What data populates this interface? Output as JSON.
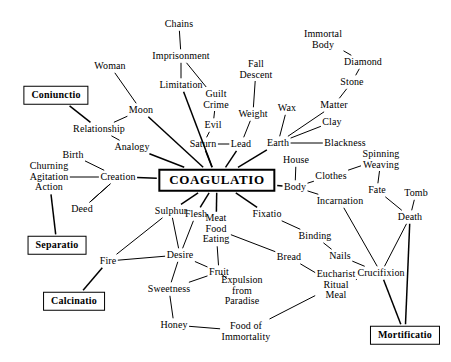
{
  "diagram": {
    "center": {
      "id": "coagulatio",
      "label": "COAGULATIO",
      "x": 217,
      "y": 180,
      "type": "center"
    },
    "operations": [
      {
        "id": "coniunctio",
        "label": "Coniunctio",
        "x": 56,
        "y": 95,
        "type": "op"
      },
      {
        "id": "separatio",
        "label": "Separatio",
        "x": 57,
        "y": 245,
        "type": "op"
      },
      {
        "id": "calcinatio",
        "label": "Calcinatio",
        "x": 74,
        "y": 301,
        "type": "op"
      },
      {
        "id": "mortificatio",
        "label": "Mortificatio",
        "x": 405,
        "y": 335,
        "type": "op"
      }
    ],
    "nodes": [
      {
        "id": "chains",
        "label": "Chains",
        "x": 179,
        "y": 24
      },
      {
        "id": "imprisonment",
        "label": "Imprisonment",
        "x": 181,
        "y": 56
      },
      {
        "id": "limitation",
        "label": "Limitation",
        "x": 181,
        "y": 85
      },
      {
        "id": "woman",
        "label": "Woman",
        "x": 110,
        "y": 66
      },
      {
        "id": "moon",
        "label": "Moon",
        "x": 141,
        "y": 110
      },
      {
        "id": "relationship",
        "label": "Relationship",
        "x": 99,
        "y": 129
      },
      {
        "id": "analogy",
        "label": "Analogy",
        "x": 132,
        "y": 147
      },
      {
        "id": "birth",
        "label": "Birth",
        "x": 73,
        "y": 155
      },
      {
        "id": "churning",
        "label": "Churning\nAgitation\nAction",
        "x": 49,
        "y": 177
      },
      {
        "id": "creation",
        "label": "Creation",
        "x": 118,
        "y": 177
      },
      {
        "id": "deed",
        "label": "Deed",
        "x": 82,
        "y": 209
      },
      {
        "id": "guiltcrime",
        "label": "Guilt\nCrime",
        "x": 216,
        "y": 99
      },
      {
        "id": "evil",
        "label": "Evil",
        "x": 213,
        "y": 125
      },
      {
        "id": "saturn",
        "label": "Saturn",
        "x": 203,
        "y": 144
      },
      {
        "id": "lead",
        "label": "Lead",
        "x": 241,
        "y": 144
      },
      {
        "id": "falldescent",
        "label": "Fall\nDescent",
        "x": 256,
        "y": 69
      },
      {
        "id": "weight",
        "label": "Weight",
        "x": 253,
        "y": 114
      },
      {
        "id": "wax",
        "label": "Wax",
        "x": 287,
        "y": 108
      },
      {
        "id": "immortalbody",
        "label": "Immortal\nBody",
        "x": 323,
        "y": 39
      },
      {
        "id": "diamond",
        "label": "Diamond",
        "x": 363,
        "y": 62
      },
      {
        "id": "stone",
        "label": "Stone",
        "x": 352,
        "y": 82
      },
      {
        "id": "matter",
        "label": "Matter",
        "x": 334,
        "y": 105
      },
      {
        "id": "clay",
        "label": "Clay",
        "x": 332,
        "y": 122
      },
      {
        "id": "earth",
        "label": "Earth",
        "x": 278,
        "y": 143
      },
      {
        "id": "blackness",
        "label": "Blackness",
        "x": 345,
        "y": 143
      },
      {
        "id": "house",
        "label": "House",
        "x": 296,
        "y": 160
      },
      {
        "id": "body",
        "label": "Body",
        "x": 295,
        "y": 187
      },
      {
        "id": "clothes",
        "label": "Clothes",
        "x": 331,
        "y": 176
      },
      {
        "id": "spinning",
        "label": "Spinning\nWeaving",
        "x": 381,
        "y": 159
      },
      {
        "id": "fate",
        "label": "Fate",
        "x": 377,
        "y": 190
      },
      {
        "id": "incarnation",
        "label": "Incarnation",
        "x": 340,
        "y": 201
      },
      {
        "id": "tomb",
        "label": "Tomb",
        "x": 416,
        "y": 193
      },
      {
        "id": "death",
        "label": "Death",
        "x": 410,
        "y": 217
      },
      {
        "id": "fixatio",
        "label": "Fixatio",
        "x": 267,
        "y": 214
      },
      {
        "id": "binding",
        "label": "Binding",
        "x": 315,
        "y": 236
      },
      {
        "id": "nails",
        "label": "Nails",
        "x": 340,
        "y": 256
      },
      {
        "id": "crucifixion",
        "label": "Crucifixion",
        "x": 381,
        "y": 273
      },
      {
        "id": "meat",
        "label": "Meat\nFood\nEating",
        "x": 216,
        "y": 229
      },
      {
        "id": "bread",
        "label": "Bread",
        "x": 289,
        "y": 257
      },
      {
        "id": "eucharist",
        "label": "Eucharist\nRitual\nMeal",
        "x": 336,
        "y": 285
      },
      {
        "id": "sulphur",
        "label": "Sulphur",
        "x": 171,
        "y": 211
      },
      {
        "id": "flesh",
        "label": "Flesh",
        "x": 196,
        "y": 214
      },
      {
        "id": "desire",
        "label": "Desire",
        "x": 180,
        "y": 255
      },
      {
        "id": "fire",
        "label": "Fire",
        "x": 108,
        "y": 261
      },
      {
        "id": "fruit",
        "label": "Fruit",
        "x": 219,
        "y": 272
      },
      {
        "id": "sweetness",
        "label": "Sweetness",
        "x": 169,
        "y": 289
      },
      {
        "id": "expulsion",
        "label": "Expulsion\nfrom\nParadise",
        "x": 242,
        "y": 291
      },
      {
        "id": "honey",
        "label": "Honey",
        "x": 174,
        "y": 325
      },
      {
        "id": "foodimm",
        "label": "Food of\nImmortality",
        "x": 246,
        "y": 331
      }
    ],
    "edges": [
      [
        "chains",
        "imprisonment"
      ],
      [
        "imprisonment",
        "limitation"
      ],
      [
        "imprisonment",
        "guiltcrime"
      ],
      [
        "limitation",
        "coagulatio"
      ],
      [
        "woman",
        "moon"
      ],
      [
        "moon",
        "relationship"
      ],
      [
        "coniunctio",
        "relationship"
      ],
      [
        "relationship",
        "analogy"
      ],
      [
        "moon",
        "coagulatio"
      ],
      [
        "analogy",
        "coagulatio"
      ],
      [
        "birth",
        "creation"
      ],
      [
        "churning",
        "creation"
      ],
      [
        "churning",
        "separatio"
      ],
      [
        "creation",
        "deed"
      ],
      [
        "creation",
        "coagulatio"
      ],
      [
        "deed",
        "creation"
      ],
      [
        "guiltcrime",
        "evil"
      ],
      [
        "evil",
        "saturn"
      ],
      [
        "saturn",
        "lead"
      ],
      [
        "saturn",
        "coagulatio"
      ],
      [
        "lead",
        "coagulatio"
      ],
      [
        "falldescent",
        "weight"
      ],
      [
        "weight",
        "lead"
      ],
      [
        "wax",
        "earth"
      ],
      [
        "immortalbody",
        "diamond"
      ],
      [
        "diamond",
        "stone"
      ],
      [
        "stone",
        "matter"
      ],
      [
        "matter",
        "earth"
      ],
      [
        "clay",
        "earth"
      ],
      [
        "earth",
        "blackness"
      ],
      [
        "earth",
        "coagulatio"
      ],
      [
        "house",
        "body"
      ],
      [
        "body",
        "coagulatio"
      ],
      [
        "body",
        "clothes"
      ],
      [
        "clothes",
        "spinning"
      ],
      [
        "spinning",
        "fate"
      ],
      [
        "body",
        "incarnation"
      ],
      [
        "fate",
        "death"
      ],
      [
        "tomb",
        "death"
      ],
      [
        "death",
        "crucifixion"
      ],
      [
        "death",
        "mortificatio"
      ],
      [
        "crucifixion",
        "mortificatio"
      ],
      [
        "incarnation",
        "crucifixion"
      ],
      [
        "fixatio",
        "coagulatio"
      ],
      [
        "fixatio",
        "binding"
      ],
      [
        "binding",
        "nails"
      ],
      [
        "nails",
        "crucifixion"
      ],
      [
        "meat",
        "coagulatio"
      ],
      [
        "meat",
        "bread"
      ],
      [
        "bread",
        "eucharist"
      ],
      [
        "eucharist",
        "crucifixion"
      ],
      [
        "sulphur",
        "coagulatio"
      ],
      [
        "sulphur",
        "fire"
      ],
      [
        "sulphur",
        "desire"
      ],
      [
        "flesh",
        "coagulatio"
      ],
      [
        "flesh",
        "desire"
      ],
      [
        "fire",
        "desire"
      ],
      [
        "fire",
        "calcinatio"
      ],
      [
        "desire",
        "sweetness"
      ],
      [
        "desire",
        "fruit"
      ],
      [
        "fruit",
        "sweetness"
      ],
      [
        "fruit",
        "expulsion"
      ],
      [
        "fruit",
        "meat"
      ],
      [
        "sweetness",
        "honey"
      ],
      [
        "honey",
        "foodimm"
      ],
      [
        "foodimm",
        "eucharist"
      ]
    ]
  }
}
